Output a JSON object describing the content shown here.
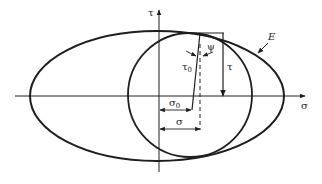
{
  "diagram": {
    "type": "stress-space failure envelope with Mohr circle",
    "axes": {
      "horizontal": {
        "label": "σ"
      },
      "vertical": {
        "label": "τ"
      }
    },
    "curves": {
      "ellipse": {
        "label": "E"
      },
      "circle": {
        "label": ""
      }
    },
    "annotations": {
      "psi": "ψ",
      "tau0": "τ",
      "tau0_sub": "0",
      "tau": "τ",
      "sigma0": "σ",
      "sigma0_sub": "0",
      "sigma": "σ"
    },
    "colors": {
      "ink": "#1e1e1e",
      "background": "#ffffff"
    }
  }
}
